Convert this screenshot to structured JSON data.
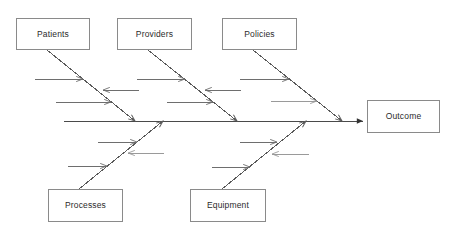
{
  "diagram": {
    "type": "fishbone-ishikawa",
    "title": "",
    "colors": {
      "background": "#ffffff",
      "box_border": "#8a8a8a",
      "spine": "#4a4a4a",
      "bone": "#5a5a5a",
      "sub_arrow": "#6e6e6e",
      "sub_arrow_light": "#9a9a9a",
      "text": "#2b2b2b"
    },
    "spine": {
      "name": "main-spine",
      "x1": 64,
      "y1": 121,
      "x2": 363,
      "y2": 121,
      "arrowhead": "solid-right"
    },
    "effect": {
      "label": "Outcome",
      "box": {
        "x": 367,
        "y": 100,
        "w": 73,
        "h": 33
      }
    },
    "categories": [
      {
        "label": "Patients",
        "position": "top",
        "box": {
          "x": 16,
          "y": 18,
          "w": 74,
          "h": 32
        },
        "bone": {
          "x1": 47,
          "y1": 50,
          "x2": 135,
          "y2": 121
        },
        "sub_arrows": [
          {
            "dir": "right",
            "y": 79,
            "from": 35,
            "to": 83,
            "tone": "normal"
          },
          {
            "dir": "left",
            "y": 90,
            "from": 139,
            "to": 103,
            "tone": "normal"
          },
          {
            "dir": "right",
            "y": 102,
            "from": 56,
            "to": 111,
            "tone": "normal"
          }
        ]
      },
      {
        "label": "Providers",
        "position": "top",
        "box": {
          "x": 117,
          "y": 18,
          "w": 75,
          "h": 32
        },
        "bone": {
          "x1": 148,
          "y1": 50,
          "x2": 237,
          "y2": 121
        },
        "sub_arrows": [
          {
            "dir": "right",
            "y": 79,
            "from": 137,
            "to": 185,
            "tone": "normal"
          },
          {
            "dir": "left",
            "y": 90,
            "from": 241,
            "to": 205,
            "tone": "normal"
          },
          {
            "dir": "right",
            "y": 102,
            "from": 167,
            "to": 213,
            "tone": "normal"
          }
        ]
      },
      {
        "label": "Policies",
        "position": "top",
        "box": {
          "x": 222,
          "y": 18,
          "w": 75,
          "h": 32
        },
        "bone": {
          "x1": 253,
          "y1": 50,
          "x2": 342,
          "y2": 121
        },
        "sub_arrows": [
          {
            "dir": "right",
            "y": 79,
            "from": 240,
            "to": 289,
            "tone": "normal"
          },
          {
            "dir": "right",
            "y": 101,
            "from": 271,
            "to": 317,
            "tone": "light"
          }
        ]
      },
      {
        "label": "Processes",
        "position": "bottom",
        "box": {
          "x": 48,
          "y": 189,
          "w": 75,
          "h": 33
        },
        "bone": {
          "x1": 79,
          "y1": 189,
          "x2": 163,
          "y2": 121
        },
        "sub_arrows": [
          {
            "dir": "right",
            "y": 142,
            "from": 98,
            "to": 137,
            "tone": "normal"
          },
          {
            "dir": "left",
            "y": 153,
            "from": 164,
            "to": 128,
            "tone": "light"
          },
          {
            "dir": "right",
            "y": 166,
            "from": 68,
            "to": 107,
            "tone": "normal"
          }
        ]
      },
      {
        "label": "Equipment",
        "position": "bottom",
        "box": {
          "x": 190,
          "y": 189,
          "w": 76,
          "h": 33
        },
        "bone": {
          "x1": 222,
          "y1": 189,
          "x2": 306,
          "y2": 121
        },
        "sub_arrows": [
          {
            "dir": "right",
            "y": 142,
            "from": 240,
            "to": 277,
            "tone": "normal"
          },
          {
            "dir": "left",
            "y": 154,
            "from": 309,
            "to": 272,
            "tone": "light"
          },
          {
            "dir": "right",
            "y": 167,
            "from": 212,
            "to": 250,
            "tone": "normal"
          }
        ]
      }
    ]
  }
}
